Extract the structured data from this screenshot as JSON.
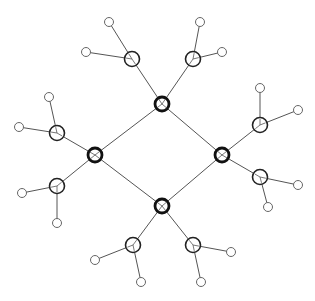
{
  "diagram": {
    "type": "molecular-graph",
    "colors": {
      "background": "#ffffff",
      "bond": "#555555",
      "core": "#111111",
      "secondary": "#222222",
      "terminal": "#666666"
    },
    "core_nodes": [
      {
        "id": "c1",
        "x": 162,
        "y": 104
      },
      {
        "id": "c2",
        "x": 95,
        "y": 155
      },
      {
        "id": "c3",
        "x": 222,
        "y": 155
      },
      {
        "id": "c4",
        "x": 162,
        "y": 206
      }
    ],
    "secondary_nodes": [
      {
        "id": "s1",
        "x": 132,
        "y": 59,
        "parent": "c1"
      },
      {
        "id": "s2",
        "x": 193,
        "y": 59,
        "parent": "c1"
      },
      {
        "id": "s3",
        "x": 57,
        "y": 133,
        "parent": "c2"
      },
      {
        "id": "s4",
        "x": 57,
        "y": 186,
        "parent": "c2"
      },
      {
        "id": "s5",
        "x": 260,
        "y": 125,
        "parent": "c3"
      },
      {
        "id": "s6",
        "x": 260,
        "y": 177,
        "parent": "c3"
      },
      {
        "id": "s7",
        "x": 133,
        "y": 245,
        "parent": "c4"
      },
      {
        "id": "s8",
        "x": 193,
        "y": 245,
        "parent": "c4"
      }
    ],
    "terminal_nodes": [
      {
        "x": 109,
        "y": 22,
        "parent": "s1"
      },
      {
        "x": 86,
        "y": 52,
        "parent": "s1"
      },
      {
        "x": 200,
        "y": 22,
        "parent": "s2"
      },
      {
        "x": 222,
        "y": 52,
        "parent": "s2"
      },
      {
        "x": 49,
        "y": 97,
        "parent": "s3"
      },
      {
        "x": 19,
        "y": 127,
        "parent": "s3"
      },
      {
        "x": 22,
        "y": 193,
        "parent": "s4"
      },
      {
        "x": 57,
        "y": 223,
        "parent": "s4"
      },
      {
        "x": 260,
        "y": 88,
        "parent": "s5"
      },
      {
        "x": 298,
        "y": 110,
        "parent": "s5"
      },
      {
        "x": 298,
        "y": 185,
        "parent": "s6"
      },
      {
        "x": 268,
        "y": 207,
        "parent": "s6"
      },
      {
        "x": 95,
        "y": 260,
        "parent": "s7"
      },
      {
        "x": 141,
        "y": 282,
        "parent": "s7"
      },
      {
        "x": 231,
        "y": 252,
        "parent": "s8"
      },
      {
        "x": 201,
        "y": 282,
        "parent": "s8"
      }
    ],
    "ring_bonds": [
      [
        "c1",
        "c2"
      ],
      [
        "c1",
        "c3"
      ],
      [
        "c2",
        "c4"
      ],
      [
        "c3",
        "c4"
      ]
    ]
  }
}
